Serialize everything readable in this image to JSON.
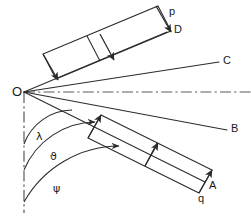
{
  "figure": {
    "kind": "geometry-diagram",
    "background_color": "#ffffff",
    "line_color": "#2b2b2b",
    "axis_color": "#555555",
    "width": 251,
    "height": 217
  },
  "labels": {
    "origin": "O",
    "ray_a": "A",
    "ray_b": "B",
    "ray_c": "C",
    "ray_d": "D",
    "band_upper": "p",
    "band_lower": "q",
    "angle_lambda": "λ",
    "angle_theta": "ϑ",
    "angle_psi": "ψ"
  },
  "geometry": {
    "origin": {
      "x": 24,
      "y": 92
    },
    "rays": [
      {
        "name": "OD",
        "label": "D",
        "end": {
          "x": 167,
          "y": 32
        },
        "label_pos": {
          "x": 175,
          "y": 26
        }
      },
      {
        "name": "OC",
        "label": "C",
        "end": {
          "x": 219,
          "y": 62
        },
        "label_pos": {
          "x": 224,
          "y": 56
        }
      },
      {
        "name": "OB",
        "label": "B",
        "end": {
          "x": 227,
          "y": 130
        },
        "label_pos": {
          "x": 232,
          "y": 124
        }
      },
      {
        "name": "OA",
        "label": "A",
        "end": {
          "x": 205,
          "y": 182
        },
        "label_pos": {
          "x": 210,
          "y": 181
        }
      }
    ],
    "dash_dot_axes": [
      {
        "name": "horizontal-axis",
        "from": {
          "x": 24,
          "y": 92
        },
        "to": {
          "x": 251,
          "y": 92
        }
      },
      {
        "name": "vertical-axis",
        "from": {
          "x": 24,
          "y": 92
        },
        "to": {
          "x": 24,
          "y": 213
        }
      }
    ],
    "angle_arcs": [
      {
        "name": "lambda-arc",
        "radius": 52,
        "label": "λ",
        "label_pos": {
          "x": 37,
          "y": 133
        }
      },
      {
        "name": "theta-arc",
        "radius": 78,
        "label": "ϑ",
        "label_pos": {
          "x": 50,
          "y": 152
        }
      },
      {
        "name": "psi-arc",
        "radius": 110,
        "label": "ψ",
        "label_pos": {
          "x": 53,
          "y": 184
        }
      }
    ],
    "upper_band": {
      "name": "p-band",
      "label": "p",
      "label_pos": {
        "x": 169,
        "y": 10
      },
      "arrow_count": 2,
      "arrow_direction": "perpendicular-into-OD"
    },
    "lower_band": {
      "name": "q-band",
      "label": "q",
      "label_pos": {
        "x": 199,
        "y": 195
      },
      "arrow_count": 2,
      "arrow_direction": "perpendicular-into-OA"
    }
  }
}
